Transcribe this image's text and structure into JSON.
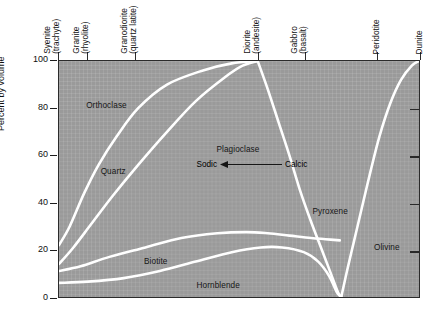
{
  "chart_data": {
    "type": "area",
    "title": "",
    "subtitle": "",
    "xlabel": "",
    "ylabel": "Percent by volume",
    "ylim": [
      0,
      100
    ],
    "xlim": [
      0,
      100
    ],
    "grid": true,
    "legend_position": "in-plot-labels",
    "x_tick_labels": [
      {
        "label_line1": "Syenite",
        "label_line2": "(trachyte)",
        "x_pct": 0
      },
      {
        "label_line1": "Granite",
        "label_line2": "(rhyolite)",
        "x_pct": 8
      },
      {
        "label_line1": "Granodiorite",
        "label_line2": "(quartz latite)",
        "x_pct": 21.3
      },
      {
        "label_line1": "Diorite",
        "label_line2": "(andesite)",
        "x_pct": 55.2
      },
      {
        "label_line1": "Gabbro",
        "label_line2": "(basalt)",
        "x_pct": 68.2
      },
      {
        "label_line1": "Peridotite",
        "label_line2": "",
        "x_pct": 88.1
      },
      {
        "label_line1": "Dunite",
        "label_line2": "",
        "x_pct": 100
      }
    ],
    "y_tick_labels": [
      "0",
      "20",
      "40",
      "60",
      "80",
      "100"
    ],
    "y_tick_values": [
      0,
      20,
      40,
      60,
      80,
      100
    ],
    "mineral_fields": [
      {
        "name": "Orthoclase",
        "label_x_pct": 7.5,
        "label_y_pct": 81
      },
      {
        "name": "Quartz",
        "label_x_pct": 11.5,
        "label_y_pct": 53.5
      },
      {
        "name": "Plagioclase",
        "label_x_pct": 43.5,
        "label_y_pct": 62.5
      },
      {
        "name": "Biotite",
        "label_x_pct": 23.5,
        "label_y_pct": 15.5
      },
      {
        "name": "Hornblende",
        "label_x_pct": 38.0,
        "label_y_pct": 5.5
      },
      {
        "name": "Pyroxene",
        "label_x_pct": 70.0,
        "label_y_pct": 36.5
      },
      {
        "name": "Olivine",
        "label_x_pct": 87.0,
        "label_y_pct": 21.5
      }
    ],
    "plagioclase_gradient": {
      "left_label": "Sodic",
      "right_label": "Calcic",
      "arrow_direction": "left",
      "label_x_pct": 38.0,
      "label_y_pct": 56.0
    },
    "boundary_curves": [
      {
        "name": "orthoclase-quartz boundary",
        "points": [
          [
            0,
            22
          ],
          [
            3,
            30
          ],
          [
            7,
            44
          ],
          [
            11,
            56
          ],
          [
            16,
            68
          ],
          [
            22,
            80
          ],
          [
            30,
            90
          ],
          [
            40,
            96
          ],
          [
            48,
            99
          ],
          [
            55.2,
            100
          ]
        ]
      },
      {
        "name": "quartz-plagioclase boundary",
        "points": [
          [
            0,
            14
          ],
          [
            4,
            21
          ],
          [
            9,
            31
          ],
          [
            15,
            43
          ],
          [
            22,
            56
          ],
          [
            30,
            70
          ],
          [
            38,
            83
          ],
          [
            46,
            93
          ],
          [
            51,
            98
          ],
          [
            55.2,
            100
          ]
        ]
      },
      {
        "name": "plagioclase-pyroxene boundary",
        "points": [
          [
            55.2,
            100
          ],
          [
            58,
            88
          ],
          [
            61,
            74
          ],
          [
            64,
            60
          ],
          [
            67,
            45
          ],
          [
            70,
            32
          ],
          [
            73,
            20
          ],
          [
            75.5,
            10
          ],
          [
            77.5,
            2
          ],
          [
            78.4,
            0
          ]
        ]
      },
      {
        "name": "pyroxene-olivine boundary",
        "points": [
          [
            78.4,
            0
          ],
          [
            80,
            11
          ],
          [
            82,
            24
          ],
          [
            84,
            37
          ],
          [
            86.5,
            53
          ],
          [
            89,
            68
          ],
          [
            92,
            82
          ],
          [
            95,
            92
          ],
          [
            98,
            98
          ],
          [
            100,
            100
          ]
        ]
      },
      {
        "name": "biotite upper boundary",
        "points": [
          [
            0,
            11
          ],
          [
            6,
            13
          ],
          [
            14,
            17
          ],
          [
            24,
            21
          ],
          [
            34,
            25
          ],
          [
            44,
            27
          ],
          [
            52,
            27.5
          ],
          [
            58,
            27
          ],
          [
            64,
            26
          ],
          [
            70,
            25
          ],
          [
            74,
            24.5
          ],
          [
            78,
            24
          ]
        ]
      },
      {
        "name": "hornblende upper boundary",
        "points": [
          [
            0,
            6
          ],
          [
            8,
            6.5
          ],
          [
            18,
            8
          ],
          [
            28,
            11
          ],
          [
            38,
            15
          ],
          [
            48,
            19
          ],
          [
            56,
            21
          ],
          [
            62,
            21
          ],
          [
            68,
            19
          ],
          [
            72,
            15
          ],
          [
            75,
            9
          ],
          [
            77.2,
            2
          ],
          [
            78.4,
            0
          ]
        ]
      }
    ]
  },
  "axes": {
    "y_title": "Percent by volume"
  }
}
